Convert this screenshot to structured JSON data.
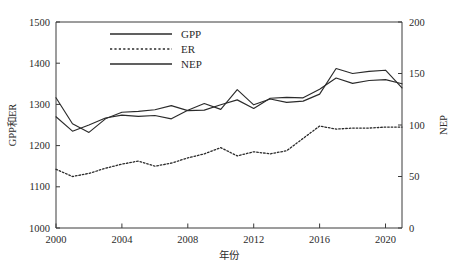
{
  "chart_data": {
    "type": "line",
    "title": "",
    "xlabel": "年份",
    "ylabel": "GPP和ER",
    "y2label": "NEP",
    "xlim": [
      2000,
      2021
    ],
    "ylim": [
      1000,
      1500
    ],
    "y2lim": [
      0,
      200
    ],
    "grid": false,
    "legend_position": "top-left-inside",
    "x_ticks": [
      2000,
      2004,
      2008,
      2012,
      2016,
      2020
    ],
    "x_tick_labels": [
      "2000",
      "2004",
      "2008",
      "2012",
      "2016",
      "2020"
    ],
    "y_ticks": [
      1000,
      1100,
      1200,
      1300,
      1400,
      1500
    ],
    "y_tick_labels": [
      "1000",
      "1100",
      "1200",
      "1300",
      "1400",
      "1500"
    ],
    "y2_ticks": [
      0,
      50,
      100,
      150,
      200
    ],
    "y2_tick_labels": [
      "0",
      "50",
      "100",
      "150",
      "200"
    ],
    "x": [
      2000,
      2001,
      2002,
      2003,
      2004,
      2005,
      2006,
      2007,
      2008,
      2009,
      2010,
      2011,
      2012,
      2013,
      2014,
      2015,
      2016,
      2017,
      2018,
      2019,
      2020,
      2021
    ],
    "series": [
      {
        "name": "GPP",
        "axis": "left",
        "style": "solid",
        "color": "#2b2b2b",
        "values": [
          1316,
          1253,
          1232,
          1265,
          1281,
          1283,
          1287,
          1297,
          1285,
          1286,
          1299,
          1311,
          1290,
          1315,
          1317,
          1316,
          1337,
          1364,
          1351,
          1358,
          1360,
          1350
        ]
      },
      {
        "name": "ER",
        "axis": "right",
        "style": "dotted",
        "color": "#2b2b2b",
        "values": [
          57,
          50,
          53,
          58,
          62,
          65,
          60,
          63,
          68,
          72,
          78,
          70,
          74,
          72,
          75,
          87,
          99,
          96,
          97,
          97,
          98,
          98
        ]
      },
      {
        "name": "NEP",
        "axis": "left",
        "style": "solid",
        "color": "#2b2b2b",
        "values": [
          1270,
          1235,
          1250,
          1267,
          1274,
          1271,
          1273,
          1265,
          1286,
          1302,
          1288,
          1336,
          1299,
          1313,
          1305,
          1308,
          1325,
          1387,
          1375,
          1380,
          1383,
          1340
        ]
      }
    ]
  },
  "legend": {
    "items": [
      {
        "label": "GPP",
        "style": "solid"
      },
      {
        "label": "ER",
        "style": "dotted"
      },
      {
        "label": "NEP",
        "style": "solid"
      }
    ]
  }
}
